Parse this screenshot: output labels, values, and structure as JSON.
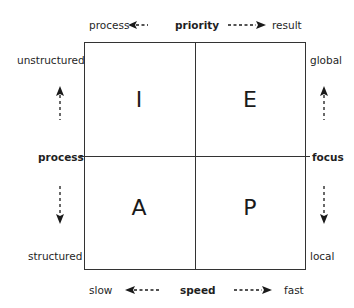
{
  "top_axis": {
    "left": "process",
    "center": "priority",
    "right": "result"
  },
  "bottom_axis": {
    "left": "slow",
    "center": "speed",
    "right": "fast"
  },
  "left_axis": {
    "top": "unstructured",
    "center": "process",
    "bottom": "structured"
  },
  "right_axis": {
    "top": "global",
    "center": "focus",
    "bottom": "local"
  },
  "quadrants": {
    "top_left": "I",
    "top_right": "E",
    "bottom_left": "A",
    "bottom_right": "P"
  },
  "colors": {
    "line": "#333333",
    "text": "#1f1f1f",
    "background": "#ffffff"
  }
}
